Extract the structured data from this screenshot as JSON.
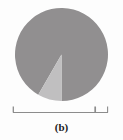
{
  "figure": {
    "caption": "(b)",
    "background_color": "#fdfdfd"
  },
  "chart_data": {
    "type": "pie",
    "title": "(b)",
    "xlabel": "",
    "ylabel": "",
    "categories": [
      "Major share",
      "Minor share"
    ],
    "values": [
      92,
      8
    ],
    "colors": [
      "#918f90",
      "#c0bfc0"
    ],
    "legend": "none",
    "grid": false,
    "start_angle_deg": 180,
    "direction": "clockwise",
    "slices": [
      {
        "name": "Major share",
        "value": 92,
        "color": "#918f90",
        "start_angle_deg": 210,
        "end_angle_deg": 540
      },
      {
        "name": "Minor share",
        "value": 8,
        "color": "#c0bfc0",
        "start_angle_deg": 180,
        "end_angle_deg": 210
      }
    ],
    "geometry": {
      "center_x": 61.5,
      "center_y": 54.5,
      "radius": 46.5
    }
  },
  "scale_bar": {
    "label": "",
    "x_start": 13,
    "x_end": 108,
    "y": 112,
    "tick_positions": [
      13,
      95,
      108
    ],
    "color": "#8c8c8c"
  }
}
